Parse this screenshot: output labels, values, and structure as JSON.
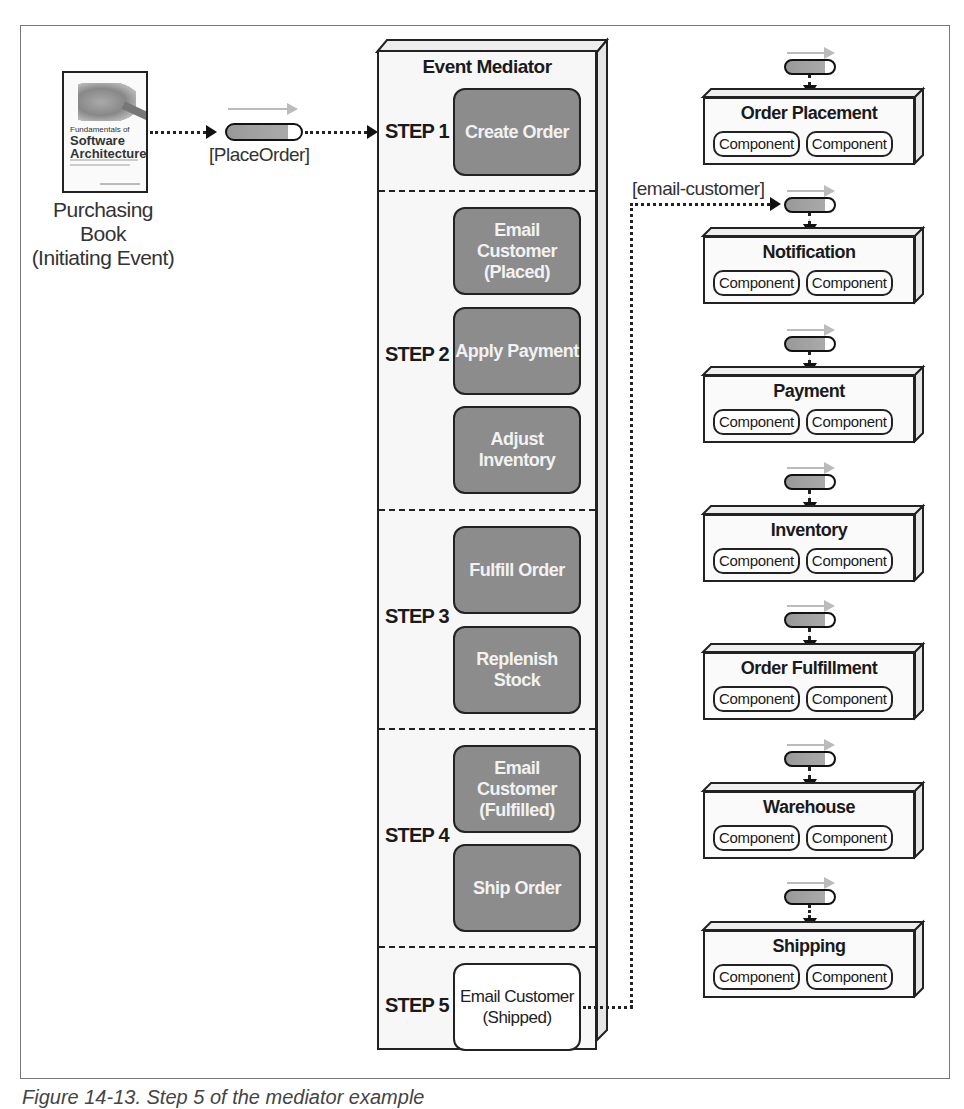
{
  "initiating_event": {
    "book": {
      "title_small": "Fundamentals of",
      "title_large": "Software Architecture"
    },
    "label_line1": "Purchasing Book",
    "label_line2": "(Initiating Event)"
  },
  "place_order_queue": {
    "label": "[PlaceOrder]"
  },
  "mediator": {
    "title": "Event Mediator",
    "steps": [
      {
        "label": "STEP 1",
        "boxes": [
          {
            "text": "Create Order",
            "style": "filled"
          }
        ]
      },
      {
        "label": "STEP 2",
        "boxes": [
          {
            "text": "Email Customer (Placed)",
            "style": "filled"
          },
          {
            "text": "Apply Payment",
            "style": "filled"
          },
          {
            "text": "Adjust Inventory",
            "style": "filled"
          }
        ]
      },
      {
        "label": "STEP 3",
        "boxes": [
          {
            "text": "Fulfill Order",
            "style": "filled"
          },
          {
            "text": "Replenish Stock",
            "style": "filled"
          }
        ]
      },
      {
        "label": "STEP 4",
        "boxes": [
          {
            "text": "Email Customer (Fulfilled)",
            "style": "filled"
          },
          {
            "text": "Ship Order",
            "style": "filled"
          }
        ]
      },
      {
        "label": "STEP 5",
        "boxes": [
          {
            "text": "Email Customer (Shipped)",
            "style": "white"
          }
        ]
      }
    ]
  },
  "email_customer_channel": {
    "label": "[email-customer]"
  },
  "services": [
    {
      "name": "Order Placement",
      "components": [
        "Component",
        "Component"
      ]
    },
    {
      "name": "Notification",
      "components": [
        "Component",
        "Component"
      ]
    },
    {
      "name": "Payment",
      "components": [
        "Component",
        "Component"
      ]
    },
    {
      "name": "Inventory",
      "components": [
        "Component",
        "Component"
      ]
    },
    {
      "name": "Order Fulfillment",
      "components": [
        "Component",
        "Component"
      ]
    },
    {
      "name": "Warehouse",
      "components": [
        "Component",
        "Component"
      ]
    },
    {
      "name": "Shipping",
      "components": [
        "Component",
        "Component"
      ]
    }
  ],
  "colors": {
    "filled_box": "#8c8c8c",
    "white_box": "#ffffff",
    "queue": "#999999",
    "outline": "#222222"
  },
  "figure_caption": "Figure 14-13. Step 5 of the mediator example"
}
